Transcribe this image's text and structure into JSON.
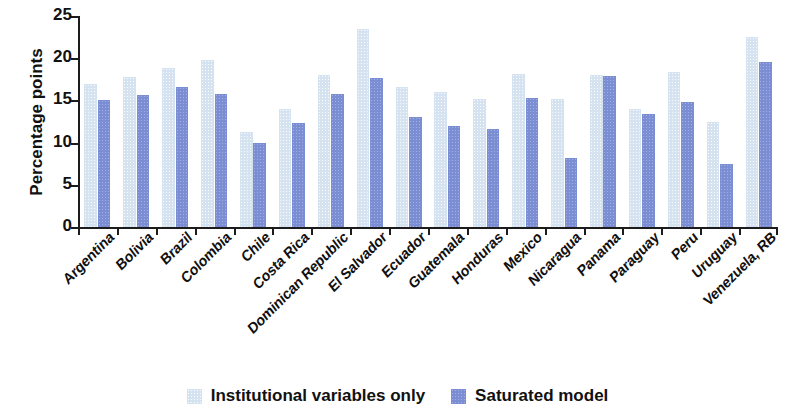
{
  "chart_data": {
    "type": "bar",
    "title": "",
    "xlabel": "",
    "ylabel": "Percentage points",
    "ylim": [
      0,
      25
    ],
    "yticks": [
      0,
      5,
      10,
      15,
      20,
      25
    ],
    "grid": false,
    "legend_position": "bottom-center",
    "categories": [
      "Argentina",
      "Bolivia",
      "Brazil",
      "Colombia",
      "Chile",
      "Costa Rica",
      "Dominican Republic",
      "El Salvador",
      "Ecuador",
      "Guatemala",
      "Honduras",
      "Mexico",
      "Nicaragua",
      "Panama",
      "Paraguay",
      "Peru",
      "Uruguay",
      "Venezuela, RB"
    ],
    "series": [
      {
        "name": "Institutional variables only",
        "color": "#d5e2ef",
        "values": [
          16.9,
          17.8,
          18.8,
          19.8,
          11.2,
          14.0,
          18.0,
          23.5,
          16.6,
          16.0,
          15.2,
          18.1,
          15.2,
          18.0,
          14.0,
          18.4,
          12.4,
          22.5
        ]
      },
      {
        "name": "Saturated model",
        "color": "#7b8ed4",
        "values": [
          15.0,
          15.7,
          16.6,
          15.8,
          9.9,
          12.3,
          15.8,
          17.6,
          13.0,
          12.0,
          11.6,
          15.3,
          8.2,
          17.9,
          13.4,
          14.8,
          7.5,
          19.6
        ]
      }
    ]
  },
  "legend": {
    "items": [
      {
        "label": "Institutional variables only",
        "color": "#d5e2ef"
      },
      {
        "label": "Saturated model",
        "color": "#7b8ed4"
      }
    ]
  }
}
